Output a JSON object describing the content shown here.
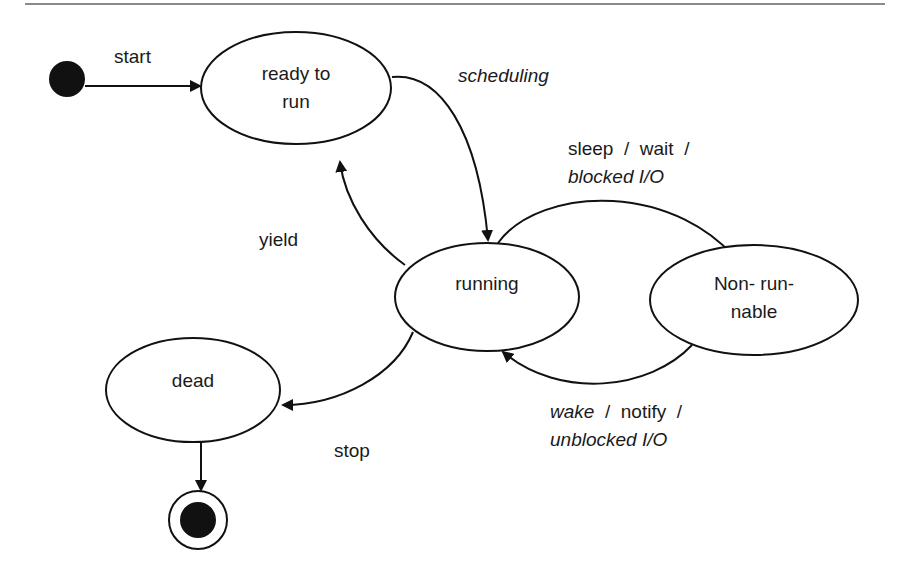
{
  "diagram": {
    "type": "state-machine",
    "title": "",
    "states": [
      {
        "id": "ready",
        "line1": "ready to",
        "line2": "run"
      },
      {
        "id": "running",
        "line1": "running"
      },
      {
        "id": "nonrunnable",
        "line1": "Non- run-",
        "line2": "nable"
      },
      {
        "id": "dead",
        "line1": "dead"
      }
    ],
    "pseudo_states": {
      "initial": "initial-state",
      "final": "final-state"
    },
    "transitions": {
      "start": {
        "from": "initial",
        "to": "ready",
        "label": "start"
      },
      "scheduling": {
        "from": "ready",
        "to": "running",
        "label": "scheduling"
      },
      "yield": {
        "from": "running",
        "to": "ready",
        "label": "yield"
      },
      "sleep": {
        "from": "running",
        "to": "nonrunnable",
        "line1": "sleep  /  wait  /",
        "line2": "blocked I/O"
      },
      "wake": {
        "from": "nonrunnable",
        "to": "running",
        "line1_italic": "wake",
        "line1_rest": "  /  notify  /",
        "line2": "unblocked I/O"
      },
      "stop": {
        "from": "running",
        "to": "dead",
        "label": "stop"
      },
      "end": {
        "from": "dead",
        "to": "final"
      }
    },
    "colors": {
      "stroke": "#111111",
      "fill": "#ffffff",
      "rule": "#8a8a8a"
    }
  }
}
